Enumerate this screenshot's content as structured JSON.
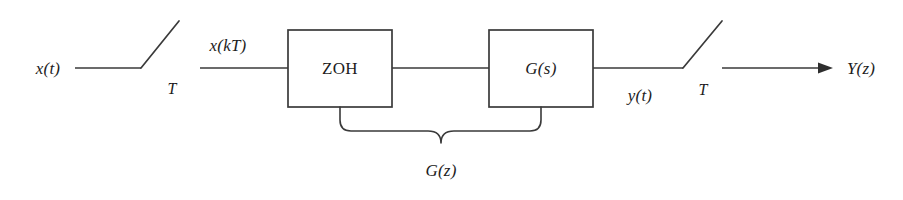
{
  "diagram": {
    "type": "block-diagram",
    "background_color": "#ffffff",
    "line_color": "#3a3a3a",
    "text_color": "#1d1d1d",
    "signals": {
      "input_continuous": "x(t)",
      "input_sampled": "x(kT)",
      "output_continuous": "y(t)",
      "output_sampled": "Y(z)"
    },
    "blocks": [
      {
        "id": "zoh",
        "label": "ZOH",
        "italic": false,
        "x": 288,
        "y": 30,
        "width": 104,
        "height": 77
      },
      {
        "id": "gs",
        "label": "G(s)",
        "italic": true,
        "x": 489,
        "y": 30,
        "width": 104,
        "height": 77
      }
    ],
    "samplers": [
      {
        "id": "input-sampler",
        "period_label": "T",
        "pivot_x": 141,
        "pivot_y": 68,
        "tip_x": 179,
        "tip_y": 21
      },
      {
        "id": "output-sampler",
        "period_label": "T",
        "pivot_x": 683,
        "pivot_y": 68,
        "tip_x": 722,
        "tip_y": 21
      }
    ],
    "grouping": {
      "label": "G(z)",
      "spans": [
        "ZOH",
        "G(s)"
      ],
      "left_x": 340,
      "right_x": 541,
      "center_x": 441
    },
    "labels": {
      "x_of_t": {
        "text": "x(t)",
        "x": 48,
        "y": 68
      },
      "period_left": {
        "text": "T",
        "x": 172,
        "y": 89
      },
      "x_of_kT": {
        "text": "x(kT)",
        "x": 228,
        "y": 45
      },
      "zoh": {
        "text": "ZOH",
        "x": 340,
        "y": 68
      },
      "g_of_s": {
        "text": "G(s)",
        "x": 541,
        "y": 68
      },
      "y_of_t": {
        "text": "y(t)",
        "x": 640,
        "y": 95
      },
      "period_right": {
        "text": "T",
        "x": 703,
        "y": 90
      },
      "g_of_z": {
        "text": "G(z)",
        "x": 441,
        "y": 170
      },
      "Y_of_z": {
        "text": "Y(z)",
        "x": 861,
        "y": 68
      }
    }
  }
}
